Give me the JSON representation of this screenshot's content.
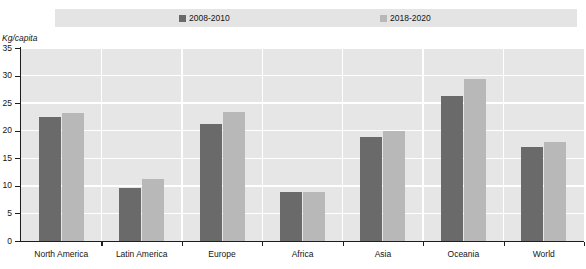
{
  "legend": {
    "entries": [
      {
        "label": "2008-2010",
        "color": "#6a6a6a"
      },
      {
        "label": "2018-2020",
        "color": "#b8b8b8"
      }
    ]
  },
  "axis": {
    "unit_label": "Kg/capita",
    "y_ticks": [
      "0",
      "5",
      "10",
      "15",
      "20",
      "25",
      "30",
      "35"
    ]
  },
  "chart_data": {
    "type": "bar",
    "title": "",
    "subtitle": "",
    "xlabel": "",
    "ylabel": "Kg/capita",
    "ylim": [
      0,
      35
    ],
    "ytick_step": 5,
    "grid": true,
    "legend_position": "top",
    "categories": [
      "North America",
      "Latin America",
      "Europe",
      "Africa",
      "Asia",
      "Oceania",
      "World"
    ],
    "series": [
      {
        "name": "2008-2010",
        "color": "#6a6a6a",
        "values": [
          22.5,
          9.7,
          21.2,
          8.8,
          18.8,
          26.3,
          17.0
        ]
      },
      {
        "name": "2018-2020",
        "color": "#b8b8b8",
        "values": [
          23.3,
          11.3,
          23.4,
          8.9,
          19.9,
          29.4,
          17.9
        ]
      }
    ]
  },
  "colors": {
    "plot_background": "#e6e6e6",
    "legend_band": "#e4e4e4",
    "gridline": "#ffffff",
    "axis": "#1d1d1d"
  }
}
